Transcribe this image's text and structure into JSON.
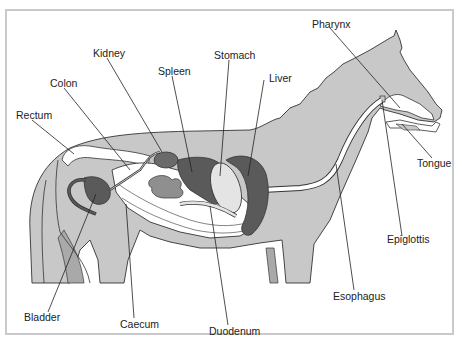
{
  "diagram": {
    "colors": {
      "body": "#c8c8c8",
      "legs_inner": "#a9a9a9",
      "dark_organ": "#5a5a5a",
      "kidney": "#6a6a6a",
      "stomach": "#e4e4e4",
      "intestine": "#ffffff",
      "coil": "#8f8f8f",
      "outline": "#333333",
      "frame": "#c9c9c9"
    },
    "labels": [
      {
        "id": "kidney",
        "text": "Kidney"
      },
      {
        "id": "colon",
        "text": "Colon"
      },
      {
        "id": "spleen",
        "text": "Spleen"
      },
      {
        "id": "stomach",
        "text": "Stomach"
      },
      {
        "id": "liver",
        "text": "Liver"
      },
      {
        "id": "pharynx",
        "text": "Pharynx"
      },
      {
        "id": "rectum",
        "text": "Rectum"
      },
      {
        "id": "tongue",
        "text": "Tongue"
      },
      {
        "id": "epiglottis",
        "text": "Epiglottis"
      },
      {
        "id": "esophagus",
        "text": "Esophagus"
      },
      {
        "id": "bladder",
        "text": "Bladder"
      },
      {
        "id": "caecum",
        "text": "Caecum"
      },
      {
        "id": "duodenum",
        "text": "Duodenum"
      }
    ]
  }
}
